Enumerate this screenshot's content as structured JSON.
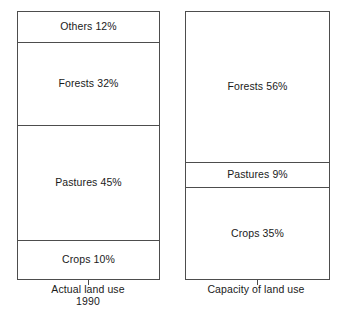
{
  "chart_data": {
    "type": "bar",
    "title": "",
    "subtitle": "",
    "xlabel": "",
    "ylabel": "",
    "ylim": [
      0,
      100
    ],
    "grid": false,
    "legend": "none",
    "orientation": "vertical-stacked",
    "categories": [
      "Actual land use 1990",
      "Capacity of land use"
    ],
    "series": [
      {
        "name": "Others",
        "values": [
          12,
          null
        ]
      },
      {
        "name": "Forests",
        "values": [
          32,
          56
        ]
      },
      {
        "name": "Pastures",
        "values": [
          45,
          9
        ]
      },
      {
        "name": "Crops",
        "values": [
          10,
          35
        ]
      }
    ],
    "charts": [
      {
        "id": "actual-land-use",
        "caption_line1": "Actual land use",
        "caption_line2": "1990",
        "segments": [
          {
            "name": "Others",
            "value": 12,
            "label": "Others 12%"
          },
          {
            "name": "Forests",
            "value": 32,
            "label": "Forests 32%"
          },
          {
            "name": "Pastures",
            "value": 45,
            "label": "Pastures 45%"
          },
          {
            "name": "Crops",
            "value": 10,
            "label": "Crops 10%"
          }
        ]
      },
      {
        "id": "capacity-of-land-use",
        "caption_line1": "Capacity of land use",
        "caption_line2": "",
        "segments": [
          {
            "name": "Forests",
            "value": 56,
            "label": "Forests 56%"
          },
          {
            "name": "Pastures",
            "value": 9,
            "label": "Pastures 9%"
          },
          {
            "name": "Crops",
            "value": 35,
            "label": "Crops 35%"
          }
        ]
      }
    ],
    "colors": {
      "stroke": "#4d4d4d",
      "fill": "#ffffff",
      "text": "#1a1a1a",
      "background": "#ffffff"
    }
  }
}
